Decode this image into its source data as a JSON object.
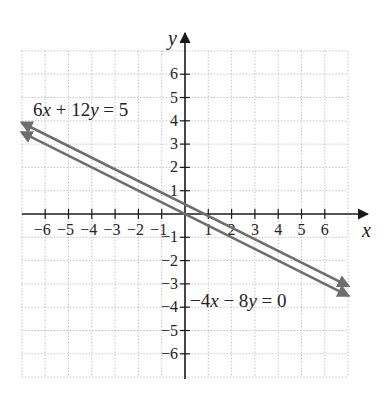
{
  "chart_data": {
    "type": "line",
    "title": "",
    "xlabel": "x",
    "ylabel": "y",
    "xlim": [
      -7,
      7
    ],
    "ylim": [
      -7,
      7
    ],
    "grid": true,
    "x_ticks": [
      -6,
      -5,
      -4,
      -3,
      -2,
      -1,
      1,
      2,
      3,
      4,
      5,
      6
    ],
    "y_ticks": [
      -6,
      -5,
      -4,
      -3,
      -2,
      -1,
      1,
      2,
      3,
      4,
      5,
      6
    ],
    "x_tick_labels": [
      "−6",
      "−5",
      "−4",
      "−3",
      "−2",
      "−1",
      "1",
      "2",
      "3",
      "4",
      "5",
      "6"
    ],
    "y_tick_labels": [
      "−6",
      "−5",
      "−4",
      "−3",
      "−2",
      "−1",
      "1",
      "2",
      "3",
      "4",
      "5",
      "6"
    ],
    "series": [
      {
        "name": "6x + 12y = 5",
        "equation": "y = 5/12 - x/2",
        "slope": -0.5,
        "intercept": 0.4167,
        "x": [
          -7,
          7
        ],
        "y": [
          3.917,
          -3.083
        ],
        "arrows": "both",
        "label": {
          "parts": [
            "6",
            "x",
            " + 12",
            "y",
            " = 5"
          ],
          "italic": [
            false,
            true,
            false,
            true,
            false
          ],
          "x": 33,
          "y": 116
        }
      },
      {
        "name": "−4x − 8y = 0",
        "equation": "y = -x/2",
        "slope": -0.5,
        "intercept": 0,
        "x": [
          -7,
          7
        ],
        "y": [
          3.5,
          -3.5
        ],
        "arrows": "both",
        "label": {
          "parts": [
            "−4",
            "x",
            " − 8",
            "y",
            " = 0"
          ],
          "italic": [
            false,
            true,
            false,
            true,
            false
          ],
          "x": 190,
          "y": 307
        }
      }
    ],
    "annotations": [
      "6x + 12y = 5",
      "−4x − 8y = 0"
    ]
  },
  "colors": {
    "axis": "#1a1a1a",
    "grid": "#b5b5b5",
    "lines": "#6e6e6e",
    "text": "#222222",
    "background": "#ffffff"
  },
  "layout": {
    "origin_px": [
      185,
      214
    ],
    "unit_px": 23.3,
    "x_axis_arrow_end_px": 368,
    "y_axis_arrow_end_px": 33,
    "y_axis_bottom_px": 379
  }
}
